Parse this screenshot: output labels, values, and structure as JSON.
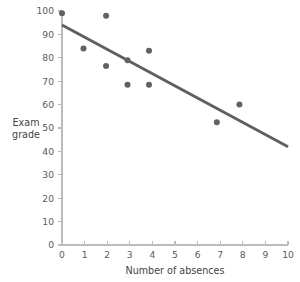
{
  "chart_data": {
    "type": "scatter",
    "title": "",
    "xlabel": "Number of absences",
    "ylabel": "Exam grade",
    "ylabel_lines": [
      "Exam",
      "grade"
    ],
    "xlim": [
      0,
      10
    ],
    "ylim": [
      0,
      100
    ],
    "xticks": [
      0,
      1,
      2,
      3,
      4,
      5,
      6,
      7,
      8,
      9,
      10
    ],
    "xtick_labels": [
      "0",
      "1",
      "2",
      "3",
      "4",
      "5",
      "6",
      "7",
      "8",
      "9",
      "10"
    ],
    "yticks": [
      0,
      10,
      20,
      30,
      40,
      50,
      60,
      70,
      80,
      90,
      100
    ],
    "ytick_labels": [
      "0",
      "10",
      "20",
      "30",
      "40",
      "50",
      "60",
      "70",
      "80",
      "90",
      "100"
    ],
    "grid": false,
    "legend": false,
    "points": [
      {
        "x": 0.0,
        "y": 99
      },
      {
        "x": 0.95,
        "y": 84
      },
      {
        "x": 1.95,
        "y": 98
      },
      {
        "x": 1.95,
        "y": 76.5
      },
      {
        "x": 2.9,
        "y": 79
      },
      {
        "x": 2.9,
        "y": 68.5
      },
      {
        "x": 3.85,
        "y": 83
      },
      {
        "x": 3.85,
        "y": 68.5
      },
      {
        "x": 6.85,
        "y": 52.5
      },
      {
        "x": 7.85,
        "y": 60
      }
    ],
    "point_color": "#616161",
    "point_radius": 3.0,
    "trend_line": {
      "x1": 0,
      "y1": 94,
      "x2": 10,
      "y2": 42,
      "color": "#5f5f5f",
      "width": 2.9
    },
    "axis_color": "#bcbcbc",
    "text_color": "#5a5a5a",
    "background": "#ffffff"
  }
}
